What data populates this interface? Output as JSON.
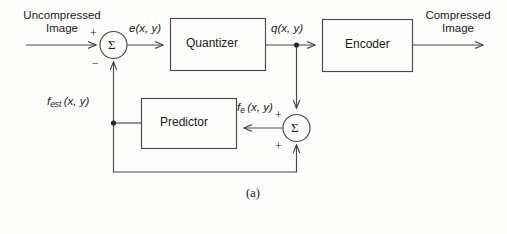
{
  "figure": {
    "caption": "(a)",
    "stroke_color": "#4a4a4a",
    "text_color": "#1a1a1a",
    "background_color": "#fdfdfc"
  },
  "io": {
    "input_line1": "Uncompressed",
    "input_line2": "Image",
    "output_line1": "Compressed",
    "output_line2": "Image"
  },
  "blocks": {
    "quantizer": "Quantizer",
    "encoder": "Encoder",
    "predictor": "Predictor"
  },
  "adders": {
    "first": {
      "symbol": "Σ",
      "input_sign_top": "+",
      "input_sign_bottom": "−"
    },
    "second": {
      "symbol": "Σ",
      "input_sign_left": "+",
      "input_sign_bottom": "+"
    }
  },
  "signals": {
    "error": {
      "base": "e",
      "args": "(x, y)"
    },
    "quantized": {
      "base": "q",
      "args": "(x, y)"
    },
    "estimate": {
      "base": "f",
      "sub": "est",
      "args": "(x, y)"
    },
    "reconstructed": {
      "base": "f",
      "sub": "e",
      "args": "(x, y)"
    }
  }
}
